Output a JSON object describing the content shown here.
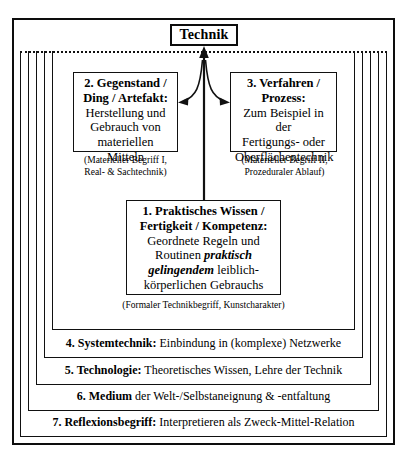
{
  "diagram": {
    "title_box": {
      "label": "Technik"
    },
    "boxes": [
      {
        "id": "box1",
        "number": "1.",
        "title_line1": "1. Praktisches Wissen /",
        "title_line2": "Fertigkeit / Kompetenz:",
        "body_line1": "Geordnete Regeln und",
        "body_line2_plain": "Routinen ",
        "body_line2_emph": "praktisch",
        "body_line3_emph": "gelingendem",
        "body_line3_plain": " leiblich-",
        "body_line4": "körperlichen Gebrauchs",
        "caption": "(Formaler Technikbegriff, Kunstcharakter)"
      },
      {
        "id": "box2",
        "number": "2.",
        "title_line1": "2. Gegenstand /",
        "title_line2": "Ding / Artefakt:",
        "body_line1": "Herstellung und",
        "body_line2": "Gebrauch von",
        "body_line3": "materiellen Mitteln",
        "caption_line1": "(Materieller Begriff I,",
        "caption_line2": "Real- & Sachtechnik)"
      },
      {
        "id": "box3",
        "number": "3.",
        "title_line1": "3. Verfahren /",
        "title_line2": "Prozess:",
        "body_line1": "Zum Beispiel in der",
        "body_line2": "Fertigungs- oder",
        "body_line3": "Oberflächentechnik",
        "caption_line1": "(Materieller Begriff II,",
        "caption_line2": "Prozeduraler Ablauf)"
      }
    ],
    "bands": [
      {
        "id": "band4",
        "bold": "4. Systemtechnik:",
        "rest": " Einbindung in (komplexe) Netzwerke"
      },
      {
        "id": "band5",
        "bold": "5. Technologie:",
        "rest": " Theoretisches Wissen, Lehre der Technik"
      },
      {
        "id": "band6",
        "bold": "6. Medium",
        "rest": " der Welt-/Selbstaneignung & -entfaltung"
      },
      {
        "id": "band7",
        "bold": "7. Reflexionsbegriff:",
        "rest": " Interpretieren als Zweck-Mittel-Relation"
      }
    ],
    "colors": {
      "ink": "#0d0d0d",
      "line": "#111111",
      "background": "#ffffff"
    },
    "arrows": {
      "up_to_technik": "arrow from box 1 upward to Technik box",
      "branch_left": "curved arrow to box 2",
      "branch_right": "curved arrow to box 3"
    }
  }
}
